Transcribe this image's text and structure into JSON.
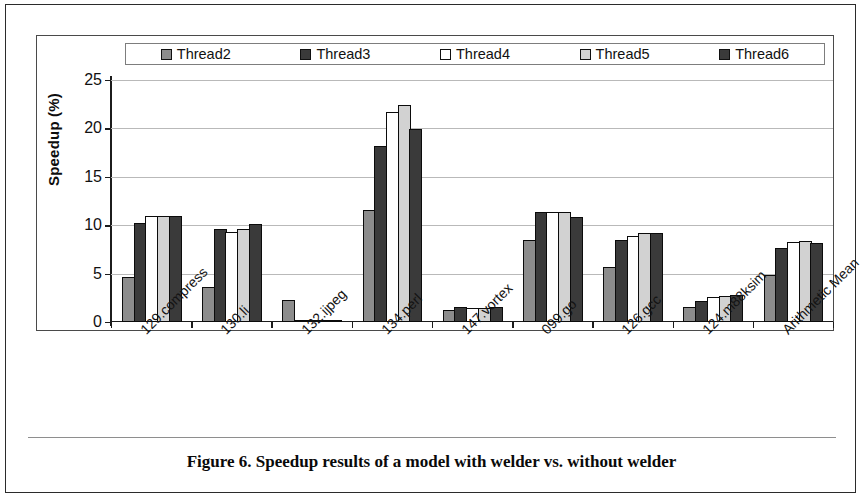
{
  "figure": {
    "caption": "Figure 6. Speedup results of a model with welder vs. without welder"
  },
  "chart_data": {
    "type": "bar",
    "title": "",
    "xlabel": "",
    "ylabel": "Speedup (%)",
    "ylim": [
      0,
      25
    ],
    "yticks": [
      0,
      5,
      10,
      15,
      20,
      25
    ],
    "grid": true,
    "legend_position": "top",
    "categories": [
      "129.compress",
      "130.li",
      "132.ijpeg",
      "134.perl",
      "147.vortex",
      "099.go",
      "126.gcc",
      "124.m88ksim",
      "Arithmetic Mean"
    ],
    "series": [
      {
        "name": "Thread2",
        "color": "#8c8c8c",
        "values": [
          4.7,
          3.6,
          2.3,
          11.6,
          1.2,
          8.5,
          5.7,
          1.6,
          4.9
        ]
      },
      {
        "name": "Thread3",
        "color": "#3a3a3a",
        "values": [
          10.2,
          9.6,
          0.1,
          18.2,
          1.5,
          11.4,
          8.5,
          2.2,
          7.6
        ]
      },
      {
        "name": "Thread4",
        "color": "#ffffff",
        "values": [
          11.0,
          9.3,
          0.1,
          21.7,
          1.4,
          11.4,
          8.9,
          2.6,
          8.3
        ]
      },
      {
        "name": "Thread5",
        "color": "#d2d2d2",
        "values": [
          11.0,
          9.6,
          0.1,
          22.4,
          1.4,
          11.4,
          9.2,
          2.7,
          8.4
        ]
      },
      {
        "name": "Thread6",
        "color": "#3a3a3a",
        "values": [
          11.0,
          10.1,
          0.1,
          19.9,
          1.6,
          10.9,
          9.2,
          2.8,
          8.2
        ]
      }
    ]
  }
}
